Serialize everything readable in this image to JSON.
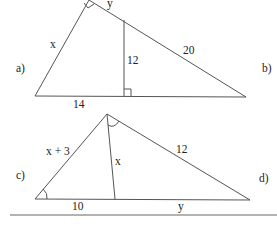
{
  "figure_a_b": {
    "part_label_left": "a)",
    "part_label_right": "b)",
    "side_x": "x",
    "side_y": "y",
    "hypotenuse_segment": "20",
    "altitude": "12",
    "base_segment": "14"
  },
  "figure_c_d": {
    "part_label_left": "c)",
    "part_label_right": "d)",
    "side_left": "x + 3",
    "cevian": "x",
    "side_right": "12",
    "base_left": "10",
    "base_right": "y"
  },
  "colors": {
    "line": "#555555",
    "text": "#222222",
    "background": "#ffffff"
  }
}
